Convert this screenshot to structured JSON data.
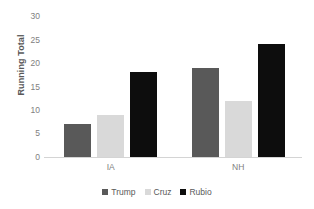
{
  "chart_data": {
    "type": "bar",
    "title": "",
    "subtitle": "",
    "xlabel": "",
    "ylabel": "Running Total",
    "categories": [
      "IA",
      "NH"
    ],
    "series": [
      {
        "name": "Trump",
        "values": [
          7,
          19
        ],
        "color": "#595959"
      },
      {
        "name": "Cruz",
        "values": [
          9,
          12
        ],
        "color": "#d9d9d9"
      },
      {
        "name": "Rubio",
        "values": [
          18,
          24
        ],
        "color": "#0d0d0d"
      }
    ],
    "ylim": [
      0,
      30
    ],
    "ytick_labels": [
      "0",
      "5",
      "10",
      "15",
      "20",
      "25",
      "30"
    ],
    "ytick_values": [
      0,
      5,
      10,
      15,
      20,
      25,
      30
    ],
    "grid": false,
    "legend_position": "bottom",
    "axis_line_color": "#d4d4d4",
    "tick_label_color": "#808080",
    "axis_title_color": "#595959",
    "background": "#ffffff"
  }
}
